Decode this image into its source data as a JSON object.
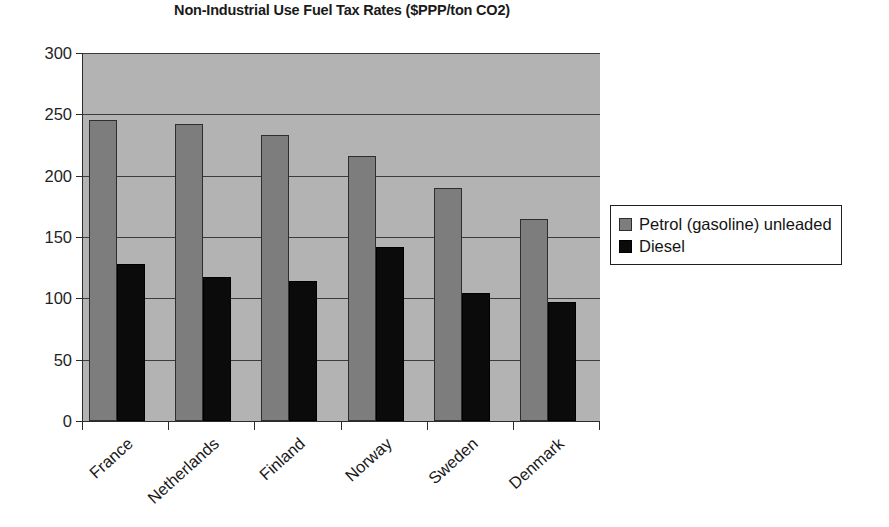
{
  "chart_data": {
    "type": "bar",
    "title": "Non-Industrial Use Fuel Tax Rates ($PPP/ton CO2)",
    "xlabel": "",
    "ylabel": "",
    "ylim": [
      0,
      300
    ],
    "ytick_step": 50,
    "yticks": [
      "300",
      "250",
      "200",
      "150",
      "100",
      "50",
      "0"
    ],
    "grid": true,
    "legend_position": "right",
    "categories": [
      "France",
      "Netherlands",
      "Finland",
      "Norway",
      "Sweden",
      "Denmark"
    ],
    "series": [
      {
        "name": "Petrol (gasoline) unleaded",
        "color": "#7d7d7d",
        "values": [
          245,
          242,
          233,
          216,
          190,
          165
        ]
      },
      {
        "name": "Diesel",
        "color": "#0b0b0b",
        "values": [
          128,
          117,
          114,
          142,
          104,
          97
        ]
      }
    ]
  },
  "legend": {
    "items": [
      {
        "label": "Petrol (gasoline) unleaded",
        "swatch": "petrol"
      },
      {
        "label": "Diesel",
        "swatch": "diesel"
      }
    ]
  },
  "colors": {
    "plot_background": "#b3b3b3",
    "axis": "#2b2b2b",
    "gridline": "#3c3c3c",
    "petrol": "#7d7d7d",
    "diesel": "#0b0b0b"
  }
}
